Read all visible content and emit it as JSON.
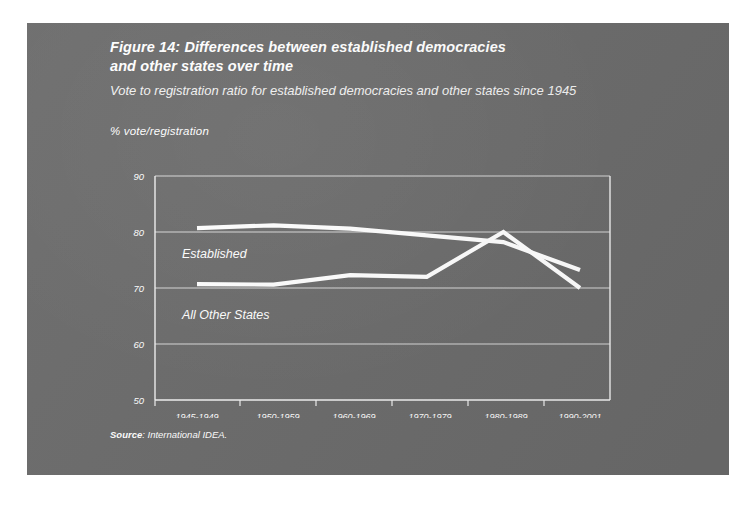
{
  "figure": {
    "title_line1": "Figure 14: Differences between established democracies",
    "title_line2": "and other states over time",
    "subtitle": "Vote to registration ratio for established democracies and other states since 1945",
    "axis_unit_label": "% vote/registration",
    "source_word": "Source",
    "source_text": ": International IDEA."
  },
  "colors": {
    "panel_background": "#6b6b6b",
    "page_background": "#ffffff",
    "line_color": "#ffffff",
    "gridline_color": "#d8d8d8",
    "text_color": "#ffffff"
  },
  "chart_data": {
    "type": "line",
    "title": "Figure 14: Differences between established democracies and other states over time",
    "subtitle": "Vote to registration ratio for established democracies and other states since 1945",
    "xlabel": "",
    "ylabel": "% vote/registration",
    "ylim": [
      50,
      90
    ],
    "yticks": [
      50,
      60,
      70,
      80,
      90
    ],
    "grid": true,
    "legend": "inline-labels",
    "categories": [
      "1945-1949",
      "1950-1959",
      "1960-1969",
      "1970-1979",
      "1980-1989",
      "1990-2001"
    ],
    "series": [
      {
        "name": "Established",
        "values": [
          80.7,
          81.2,
          80.6,
          79.4,
          78.2,
          73.2
        ]
      },
      {
        "name": "All Other States",
        "values": [
          70.7,
          70.6,
          72.3,
          72.0,
          80.0,
          70.0
        ]
      }
    ],
    "annotations": [
      {
        "text": "Established",
        "x_category": "1945-1949",
        "y_value": 76.5
      },
      {
        "text": "All Other States",
        "x_category": "1945-1949",
        "y_value": 65.5
      }
    ]
  },
  "axis": {
    "y_tick_labels": [
      "90",
      "80",
      "70",
      "60",
      "50"
    ],
    "x_tick_labels": [
      "1945-1949",
      "1950-1959",
      "1960-1969",
      "1970-1979",
      "1980-1989",
      "1990-2001"
    ]
  }
}
